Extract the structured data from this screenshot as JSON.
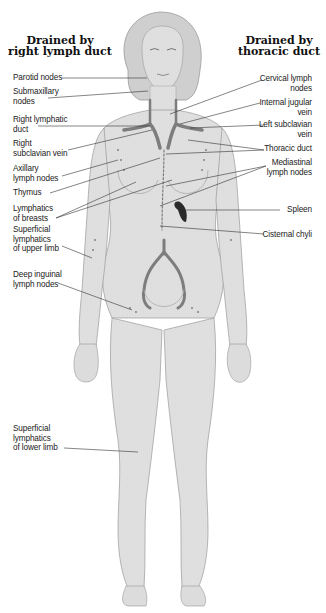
{
  "headings": {
    "left": [
      "Drained by",
      "right lymph duct"
    ],
    "right": [
      "Drained by",
      "thoracic duct"
    ]
  },
  "left_labels": [
    {
      "id": "parotid-nodes",
      "lines": [
        "Parotid nodes"
      ]
    },
    {
      "id": "submaxillary-nodes",
      "lines": [
        "Submaxillary",
        "nodes"
      ]
    },
    {
      "id": "right-lymphatic-duct",
      "lines": [
        "Right lymphatic",
        "duct"
      ]
    },
    {
      "id": "right-subclavian-vein",
      "lines": [
        "Right",
        "subclavian vein"
      ]
    },
    {
      "id": "axillary-lymph-nodes",
      "lines": [
        "Axillary",
        "lymph nodes"
      ]
    },
    {
      "id": "thymus",
      "lines": [
        "Thymus"
      ]
    },
    {
      "id": "lymphatics-of-breasts",
      "lines": [
        "Lymphatics",
        "of breasts"
      ]
    },
    {
      "id": "superficial-lymphatics-upper-limb",
      "lines": [
        "Superficial",
        "lymphatics",
        "of upper limb"
      ]
    },
    {
      "id": "deep-inguinal-lymph-nodes",
      "lines": [
        "Deep inguinal",
        "lymph nodes"
      ]
    },
    {
      "id": "superficial-lymphatics-lower-limb",
      "lines": [
        "Superficial",
        "lymphatics",
        "of lower limb"
      ]
    }
  ],
  "right_labels": [
    {
      "id": "cervical-lymph-nodes",
      "lines": [
        "Cervical lymph",
        "nodes"
      ]
    },
    {
      "id": "internal-jugular-vein",
      "lines": [
        "Internal jugular",
        "vein"
      ]
    },
    {
      "id": "left-subclavian-vein",
      "lines": [
        "Left subclavian",
        "vein"
      ]
    },
    {
      "id": "thoracic-duct",
      "lines": [
        "Thoracic duct"
      ]
    },
    {
      "id": "mediastinal-lymph-nodes",
      "lines": [
        "Mediastinal",
        "lymph nodes"
      ]
    },
    {
      "id": "spleen",
      "lines": [
        "Spleen"
      ]
    },
    {
      "id": "cisternal-chyli",
      "lines": [
        "Cisternal chyli"
      ]
    }
  ],
  "colors": {
    "skin": "#e8e8e8",
    "skin_shade": "#c9c9c9",
    "outline": "#8a8a8a",
    "vessel": "#7a7a7a",
    "spleen": "#2a2a2a",
    "leader_line": "#333333"
  }
}
